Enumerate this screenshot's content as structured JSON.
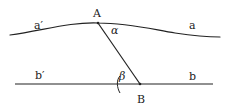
{
  "diagram": {
    "type": "geometry-sketch",
    "curve_a": {
      "name": "a",
      "left_label": "a′",
      "right_label": "a",
      "path": "M 10 35 C 45 30, 70 22, 98 23 C 130 23, 155 30, 175 33 C 195 36, 210 37, 220 37"
    },
    "line_b": {
      "name": "b",
      "left_label": "b′",
      "right_label": "b",
      "x1": 15,
      "y1": 84,
      "x2": 213,
      "y2": 84
    },
    "segment_AB": {
      "x1": 98,
      "y1": 23,
      "x2": 140,
      "y2": 84
    },
    "points": [
      {
        "name": "A",
        "label": "A",
        "x": 98,
        "y": 23
      },
      {
        "name": "B",
        "label": "B",
        "x": 140,
        "y": 84
      }
    ],
    "angles": [
      {
        "name": "alpha",
        "label": "α",
        "at": "A"
      },
      {
        "name": "beta",
        "label": "β",
        "at": "B"
      }
    ],
    "labels": {
      "a_prime": "a′",
      "a": "a",
      "b_prime": "b′",
      "b": "b",
      "A": "A",
      "B": "B",
      "alpha": "α",
      "beta": "β"
    },
    "stroke_color": "#222222"
  }
}
